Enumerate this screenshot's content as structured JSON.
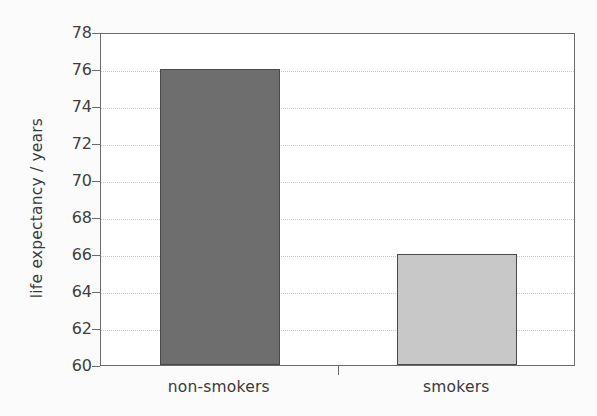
{
  "chart_data": {
    "type": "bar",
    "title": "",
    "xlabel": "",
    "ylabel": "life expectancy / years",
    "categories": [
      "non-smokers",
      "smokers"
    ],
    "values": [
      76,
      66
    ],
    "series": [
      {
        "name": "life expectancy",
        "values": [
          76,
          66
        ]
      }
    ],
    "ylim": [
      60,
      78
    ],
    "ytick_step": 2,
    "yticks": [
      60,
      62,
      64,
      66,
      68,
      70,
      72,
      74,
      76,
      78
    ],
    "ytick_labels": [
      "60",
      "62",
      "64",
      "66",
      "68",
      "70",
      "72",
      "74",
      "76",
      "78"
    ],
    "grid": true,
    "grid_axis": "y",
    "legend": "none",
    "bar_colors": [
      "#6e6e6e",
      "#c8c8c8"
    ],
    "bar_edge_color": "#4a4a4a",
    "axis_color": "#6b6b6b",
    "grid_color": "#c9c9c9",
    "background_color": "#fbfbfb",
    "plot_background_color": "#ffffff",
    "text_color": "#3a3a3a"
  }
}
